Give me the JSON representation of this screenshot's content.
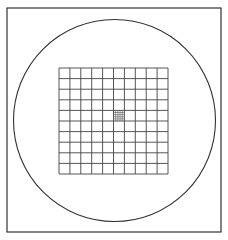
{
  "figure": {
    "frame": {
      "x": 7,
      "y": 8,
      "width": 214,
      "height": 224,
      "stroke": "#333333"
    },
    "circle": {
      "cx": 114.5,
      "cy": 120.5,
      "r": 101,
      "stroke": "#333333"
    },
    "grid": {
      "x": 59,
      "y": 68,
      "width": 109,
      "height": 106,
      "rows": 10,
      "cols": 10,
      "stroke": "#444444"
    },
    "center_subgrid": {
      "col": 5,
      "row": 4,
      "subdivisions": 5,
      "stroke": "#555555"
    }
  }
}
